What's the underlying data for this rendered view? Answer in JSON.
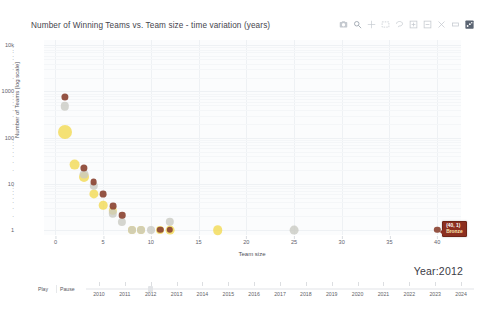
{
  "chart_data": {
    "type": "scatter",
    "title": "Number of Winning Teams vs. Team size - time variation (years)",
    "xlabel": "Team size",
    "ylabel": "Number of Teams [log scale]",
    "xlim": [
      -1.2,
      42.5
    ],
    "ylim_log": [
      0.78,
      13000
    ],
    "yscale": "log",
    "grid": true,
    "legend": "none",
    "y_ticks_major": [
      "10k",
      "1000",
      "100",
      "10",
      "1"
    ],
    "y_ticks_minor": [
      "9",
      "8",
      "7",
      "6",
      "5",
      "4",
      "3",
      "2"
    ],
    "x_ticks": [
      "0",
      "5",
      "10",
      "15",
      "20",
      "25",
      "30",
      "35",
      "40"
    ],
    "series": [
      {
        "name": "Gold",
        "color": "#f2d94e",
        "points": [
          {
            "x": 1,
            "y": 130,
            "r": 7.0
          },
          {
            "x": 2,
            "y": 26,
            "r": 5.4
          },
          {
            "x": 3,
            "y": 14,
            "r": 5.0
          },
          {
            "x": 4,
            "y": 6.0,
            "r": 4.6
          },
          {
            "x": 5,
            "y": 3.4,
            "r": 4.3
          },
          {
            "x": 6,
            "y": 2.6,
            "r": 4.2
          },
          {
            "x": 8,
            "y": 1.0,
            "r": 4.0
          },
          {
            "x": 9,
            "y": 1.0,
            "r": 4.0
          },
          {
            "x": 11,
            "y": 1.0,
            "r": 4.0
          },
          {
            "x": 12,
            "y": 1.0,
            "r": 4.4
          },
          {
            "x": 17,
            "y": 1.0,
            "r": 4.8
          }
        ]
      },
      {
        "name": "Silver",
        "color": "#c9c9c2",
        "points": [
          {
            "x": 1,
            "y": 480,
            "r": 4.2
          },
          {
            "x": 3,
            "y": 16,
            "r": 4.4
          },
          {
            "x": 4,
            "y": 9.0,
            "r": 4.2
          },
          {
            "x": 6,
            "y": 2.3,
            "r": 4.2
          },
          {
            "x": 7,
            "y": 1.5,
            "r": 4.1
          },
          {
            "x": 8,
            "y": 1.0,
            "r": 4.0
          },
          {
            "x": 9,
            "y": 1.0,
            "r": 4.0
          },
          {
            "x": 10,
            "y": 1.0,
            "r": 4.0
          },
          {
            "x": 12,
            "y": 1.5,
            "r": 4.2
          },
          {
            "x": 25,
            "y": 1.0,
            "r": 4.4
          }
        ]
      },
      {
        "name": "Bronze",
        "color": "#8c4534",
        "points": [
          {
            "x": 1,
            "y": 760,
            "r": 3.6
          },
          {
            "x": 3,
            "y": 22,
            "r": 3.6
          },
          {
            "x": 4,
            "y": 11,
            "r": 3.4
          },
          {
            "x": 5,
            "y": 6.0,
            "r": 3.4
          },
          {
            "x": 6,
            "y": 3.3,
            "r": 3.4
          },
          {
            "x": 7,
            "y": 2.1,
            "r": 3.3
          },
          {
            "x": 11,
            "y": 1.0,
            "r": 3.2
          },
          {
            "x": 12,
            "y": 1.0,
            "r": 3.2
          },
          {
            "x": 40,
            "y": 1.0,
            "r": 3.2
          }
        ]
      }
    ],
    "tooltip": {
      "coord": "(40, 1)",
      "label": "Bronze",
      "x": 40,
      "y": 1
    }
  },
  "modebar": {
    "buttons": [
      {
        "name": "camera-icon",
        "title": "Download plot as a png"
      },
      {
        "name": "zoom-box-icon",
        "title": "Zoom"
      },
      {
        "name": "pan-icon",
        "title": "Pan"
      },
      {
        "name": "box-select-icon",
        "title": "Box Select"
      },
      {
        "name": "lasso-select-icon",
        "title": "Lasso Select"
      },
      {
        "name": "zoom-in-icon",
        "title": "Zoom in"
      },
      {
        "name": "zoom-out-icon",
        "title": "Zoom out"
      },
      {
        "name": "autoscale-icon",
        "title": "Autoscale"
      },
      {
        "name": "reset-axes-icon",
        "title": "Reset axes"
      },
      {
        "name": "plotly-logo-icon",
        "title": "Produced with Plotly"
      }
    ]
  },
  "annotation": {
    "year_label": "Year:2012"
  },
  "slider": {
    "play_label": "Play",
    "pause_label": "Pause",
    "active_value": "2012",
    "steps": [
      "2010",
      "2011",
      "2012",
      "2013",
      "2014",
      "2015",
      "2016",
      "2017",
      "2018",
      "2019",
      "2020",
      "2021",
      "2022",
      "2023",
      "2024"
    ]
  }
}
